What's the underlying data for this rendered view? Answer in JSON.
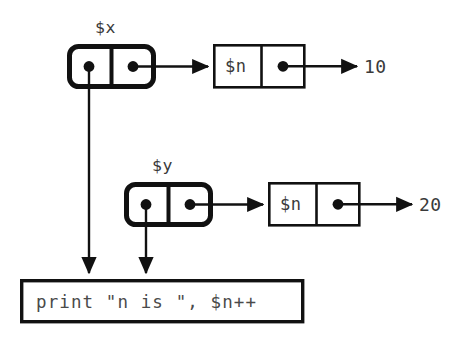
{
  "diagram": {
    "colors": {
      "ink": "#111111",
      "text": "#3a3a3a",
      "code_text": "#4a4a4a",
      "background": "#ffffff"
    },
    "rows": [
      {
        "id": "x",
        "variable_label": "$x",
        "ref_cell": {
          "left_slot": "pointer-dot",
          "right_slot": "pointer-dot"
        },
        "value_cell": {
          "name_label": "$n",
          "right_slot": "pointer-dot"
        },
        "value": "10"
      },
      {
        "id": "y",
        "variable_label": "$y",
        "ref_cell": {
          "left_slot": "pointer-dot",
          "right_slot": "pointer-dot"
        },
        "value_cell": {
          "name_label": "$n",
          "right_slot": "pointer-dot"
        },
        "value": "20"
      }
    ],
    "code_block": {
      "text": "print \"n is \", $n++"
    }
  }
}
